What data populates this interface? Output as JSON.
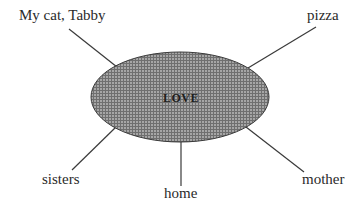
{
  "diagram": {
    "type": "concept-web",
    "center": {
      "label": "LOVE",
      "fill_color": "#8c8c8c",
      "stroke_color": "#3a3a3a",
      "pattern": "crosshatch-grid"
    },
    "nodes": [
      {
        "id": "tabby",
        "label": "My cat, Tabby"
      },
      {
        "id": "pizza",
        "label": "pizza"
      },
      {
        "id": "sisters",
        "label": "sisters"
      },
      {
        "id": "home",
        "label": "home"
      },
      {
        "id": "mother",
        "label": "mother"
      }
    ],
    "connector_color": "#3a3a3a"
  }
}
